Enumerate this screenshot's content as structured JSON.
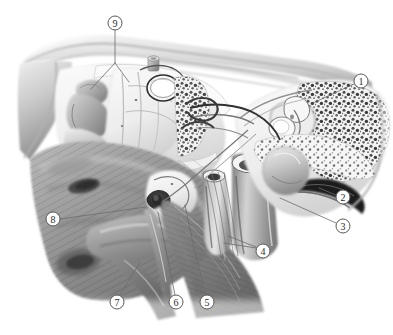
{
  "figure": {
    "style": "grayscale anatomical airbrush illustration",
    "background_color": "#ffffff",
    "width": 393,
    "height": 335,
    "line_color": "#6b6b6b",
    "circle_stroke_color": "#5a5a5a",
    "label_text_color": "#2b2b2b"
  },
  "callouts": [
    {
      "id": "callout-1",
      "label": "1",
      "cx": 361,
      "cy": 81,
      "r": 7,
      "leader": "M 354 84 L 313 103",
      "region": "mastoid air cells / epitympanum"
    },
    {
      "id": "callout-2",
      "label": "2",
      "cx": 343,
      "cy": 197,
      "r": 7,
      "leader": "M 336 195 L 319 188",
      "region": "external acoustic meatus"
    },
    {
      "id": "callout-3",
      "label": "3",
      "cx": 343,
      "cy": 226,
      "r": 7,
      "leader": "M 336 223 L 280 198",
      "region": "tympanic membrane"
    },
    {
      "id": "callout-4",
      "label": "4",
      "cx": 263,
      "cy": 251,
      "r": 7,
      "leader": "M 256 247 L 228 236 M 256 248 L 224 243",
      "region": "cartilaginous eustachian tube"
    },
    {
      "id": "callout-5",
      "label": "5",
      "cx": 207,
      "cy": 302,
      "r": 7,
      "leader": "M 206 295 L 194 248 L 185 205",
      "region": "levator veli palatini muscle"
    },
    {
      "id": "callout-6",
      "label": "6",
      "cx": 176,
      "cy": 302,
      "r": 7,
      "leader": "M 175 295 L 166 250 L 158 212",
      "region": "tensor veli palatini muscle"
    },
    {
      "id": "callout-7",
      "label": "7",
      "cx": 117,
      "cy": 302,
      "r": 7,
      "leader": "M 120 295 L 134 272 L 140 262",
      "region": "soft palate"
    },
    {
      "id": "callout-8",
      "label": "8",
      "cx": 53,
      "cy": 219,
      "r": 7,
      "leader": "M 60 219 L 146 207",
      "region": "torus tubarius / pharyngeal ostium"
    },
    {
      "id": "callout-9",
      "label": "9",
      "cx": 115,
      "cy": 23,
      "r": 7,
      "leader": "M 115 30 L 115 63 M 115 63 L 91 89 M 115 63 L 129 82",
      "region": "nasal turbinates / conchae"
    }
  ]
}
